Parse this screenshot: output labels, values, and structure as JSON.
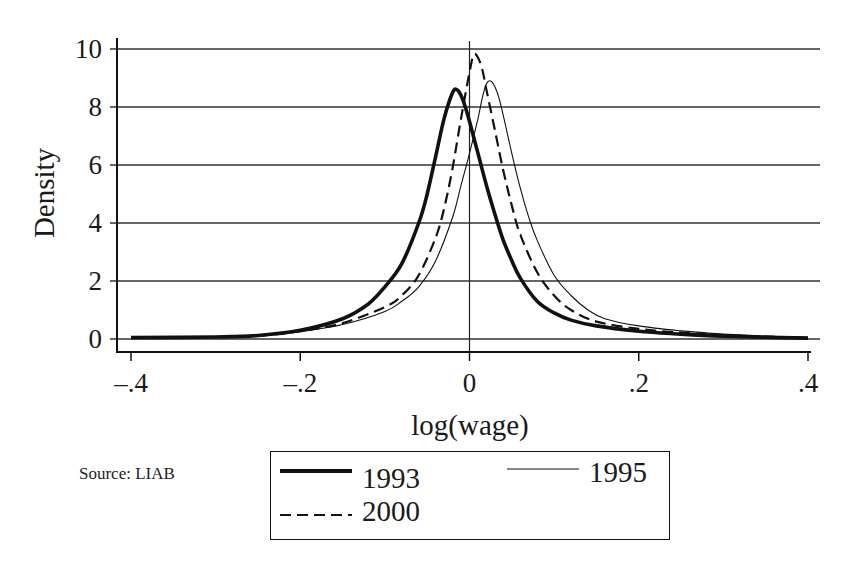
{
  "chart_data": {
    "type": "line",
    "title": "",
    "xlabel": "log(wage)",
    "ylabel": "Density",
    "xlim": [
      -0.4,
      0.4
    ],
    "ylim": [
      0,
      10
    ],
    "x_ticks": [
      "-.4",
      "-.2",
      "0",
      ".2",
      ".4"
    ],
    "y_ticks": [
      "0",
      "2",
      "4",
      "6",
      "8",
      "10"
    ],
    "grid": "horizontal",
    "reference_line_x": 0,
    "legend_position": "bottom",
    "series": [
      {
        "name": "1993",
        "style": "solid-thick",
        "x": [
          -0.4,
          -0.3,
          -0.25,
          -0.2,
          -0.15,
          -0.12,
          -0.1,
          -0.08,
          -0.06,
          -0.05,
          -0.04,
          -0.03,
          -0.02,
          -0.015,
          -0.01,
          -0.005,
          0,
          0.01,
          0.02,
          0.03,
          0.04,
          0.05,
          0.06,
          0.08,
          0.1,
          0.12,
          0.15,
          0.2,
          0.25,
          0.3,
          0.35,
          0.4
        ],
        "y": [
          0.05,
          0.07,
          0.12,
          0.3,
          0.7,
          1.2,
          1.8,
          2.6,
          4.0,
          5.0,
          6.3,
          7.6,
          8.5,
          8.6,
          8.4,
          8.0,
          7.5,
          6.4,
          5.3,
          4.3,
          3.4,
          2.7,
          2.1,
          1.3,
          0.9,
          0.65,
          0.45,
          0.27,
          0.17,
          0.1,
          0.06,
          0.03
        ]
      },
      {
        "name": "1995",
        "style": "solid-thin",
        "x": [
          -0.25,
          -0.2,
          -0.15,
          -0.1,
          -0.08,
          -0.06,
          -0.04,
          -0.02,
          -0.01,
          0,
          0.01,
          0.015,
          0.02,
          0.025,
          0.03,
          0.035,
          0.04,
          0.05,
          0.06,
          0.07,
          0.08,
          0.1,
          0.12,
          0.14,
          0.16,
          0.2,
          0.25,
          0.3,
          0.35,
          0.4
        ],
        "y": [
          0.1,
          0.25,
          0.5,
          0.95,
          1.3,
          1.8,
          2.7,
          4.2,
          5.3,
          6.4,
          7.6,
          8.3,
          8.8,
          8.9,
          8.7,
          8.3,
          7.7,
          6.4,
          5.2,
          4.2,
          3.4,
          2.2,
          1.5,
          1.0,
          0.7,
          0.45,
          0.28,
          0.17,
          0.1,
          0.05
        ]
      },
      {
        "name": "2000",
        "style": "dashed",
        "x": [
          -0.25,
          -0.2,
          -0.15,
          -0.1,
          -0.08,
          -0.06,
          -0.04,
          -0.03,
          -0.02,
          -0.01,
          0,
          0.005,
          0.01,
          0.015,
          0.02,
          0.03,
          0.04,
          0.05,
          0.06,
          0.08,
          0.1,
          0.12,
          0.15,
          0.2,
          0.25,
          0.3,
          0.35,
          0.4
        ],
        "y": [
          0.1,
          0.27,
          0.55,
          1.1,
          1.5,
          2.2,
          3.5,
          4.5,
          5.9,
          7.6,
          9.2,
          9.8,
          9.7,
          9.3,
          8.6,
          7.2,
          5.8,
          4.6,
          3.6,
          2.3,
          1.5,
          1.0,
          0.6,
          0.35,
          0.22,
          0.13,
          0.08,
          0.04
        ]
      }
    ]
  },
  "axes": {
    "xlabel": "log(wage)",
    "ylabel": "Density"
  },
  "legend": {
    "items": [
      {
        "label": "1993",
        "style": "solid-thick"
      },
      {
        "label": "1995",
        "style": "solid-thin"
      },
      {
        "label": "2000",
        "style": "dashed"
      }
    ]
  },
  "source": "Source: LIAB",
  "colors": {
    "line": "#111111",
    "grid": "#333333",
    "background": "#ffffff"
  }
}
